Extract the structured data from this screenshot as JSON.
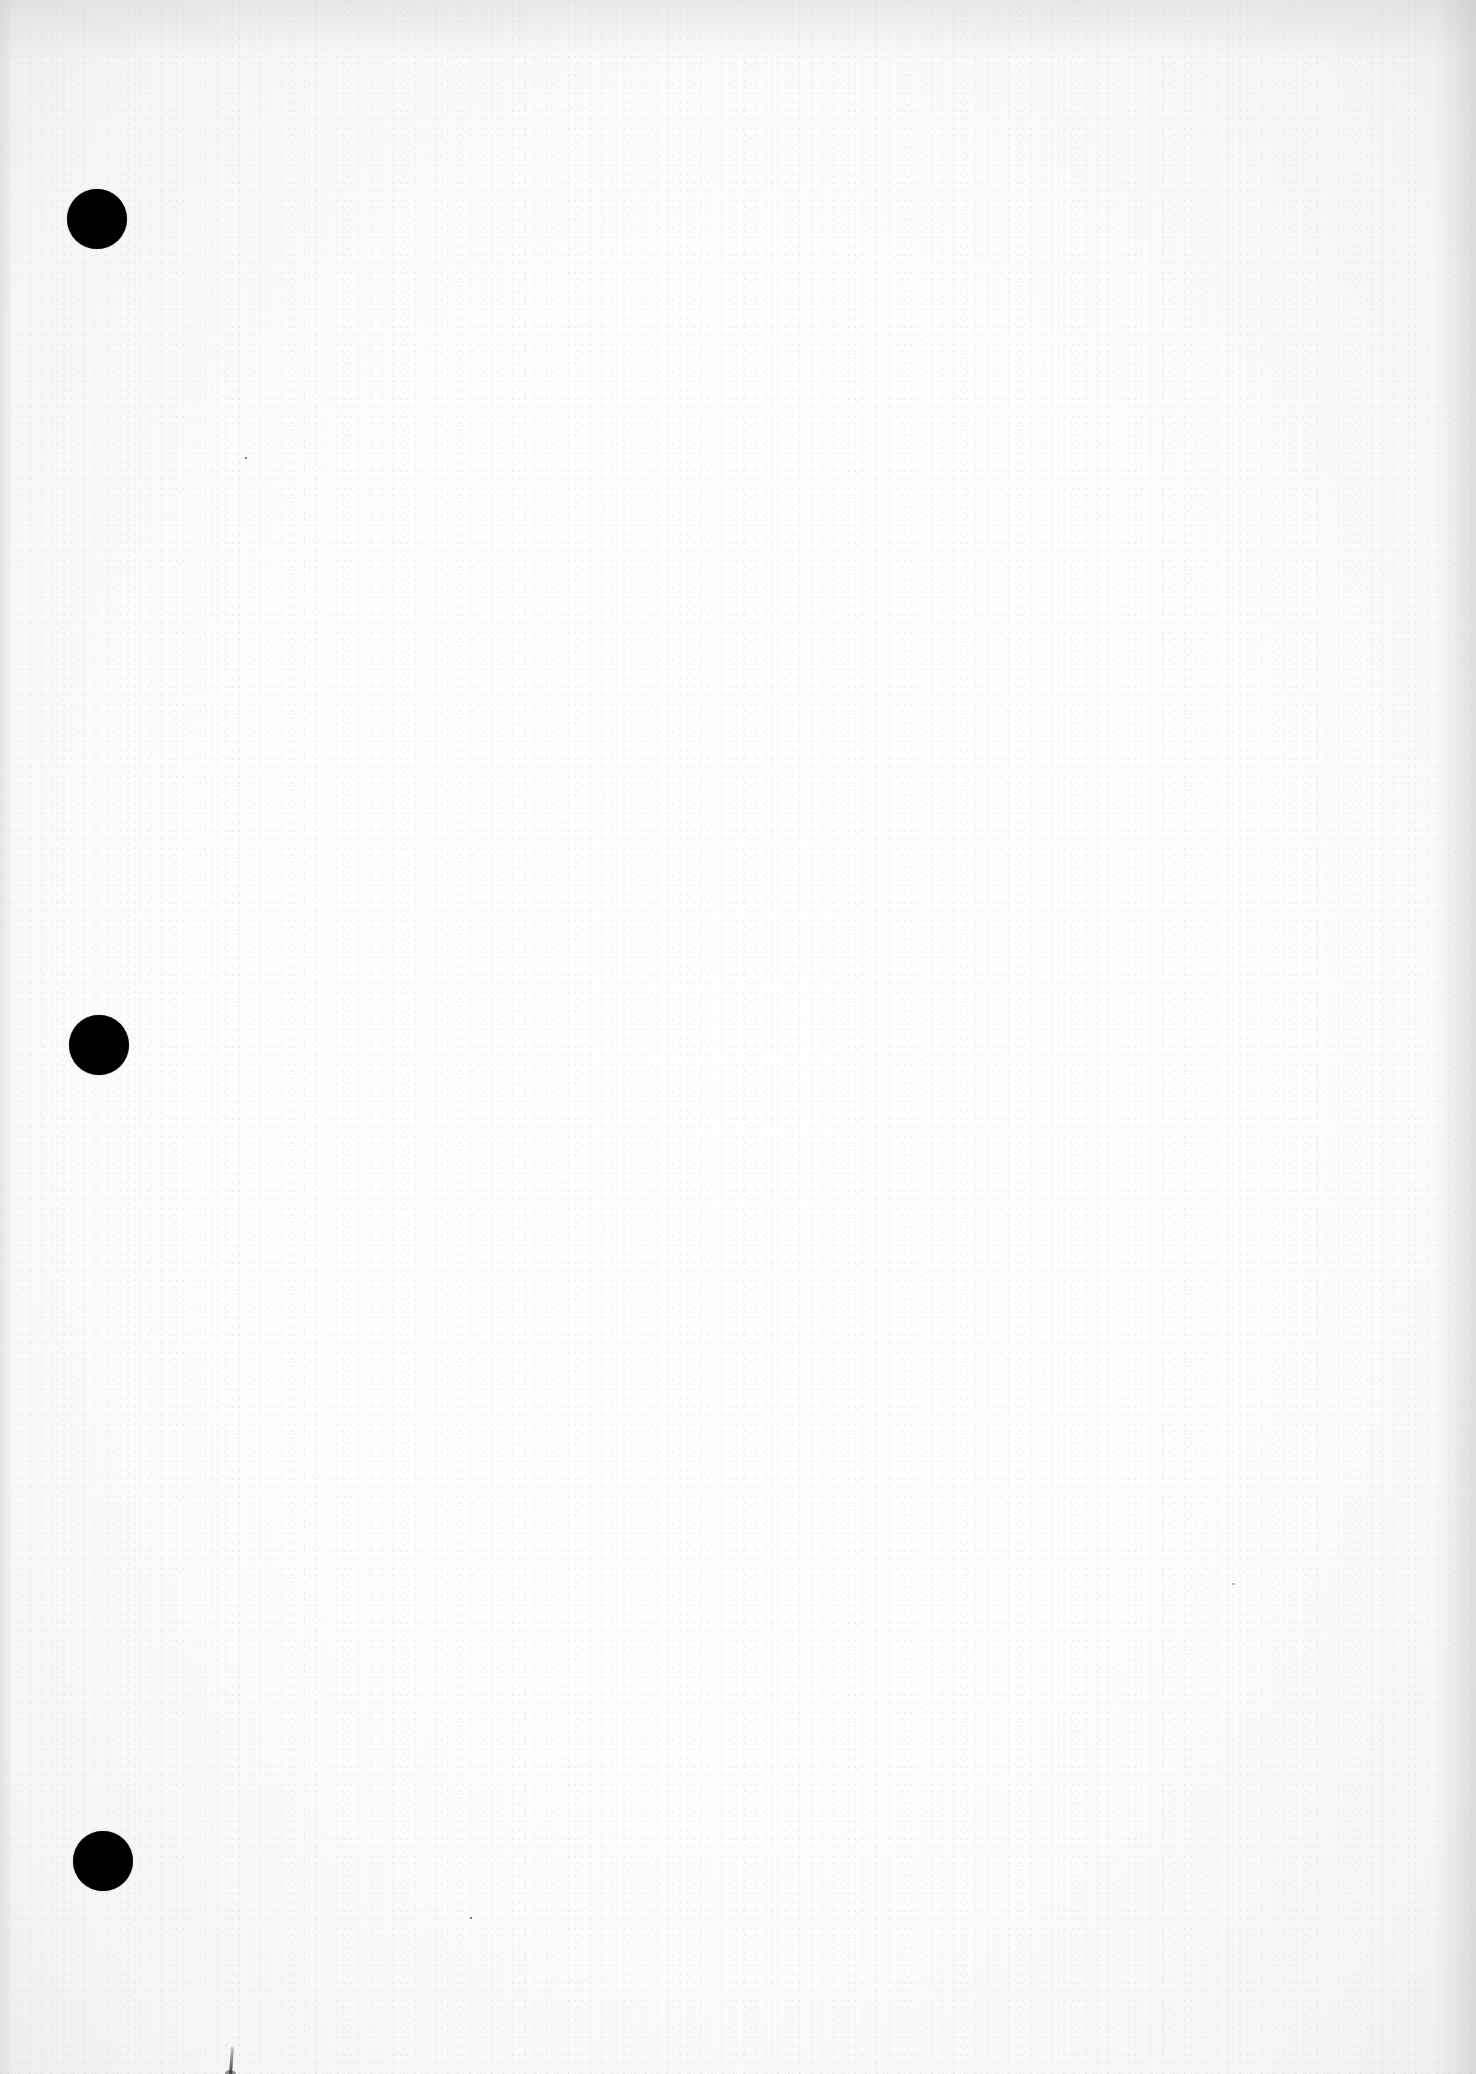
{
  "document": {
    "type": "blank scanned page",
    "text_content": "",
    "paper_color": "#fdfdfd",
    "punch_holes": [
      {
        "x": 97,
        "y": 219,
        "diameter": 60,
        "color": "#000000"
      },
      {
        "x": 99,
        "y": 1045,
        "diameter": 60,
        "color": "#000000"
      },
      {
        "x": 103,
        "y": 1861,
        "diameter": 60,
        "color": "#000000"
      }
    ]
  }
}
